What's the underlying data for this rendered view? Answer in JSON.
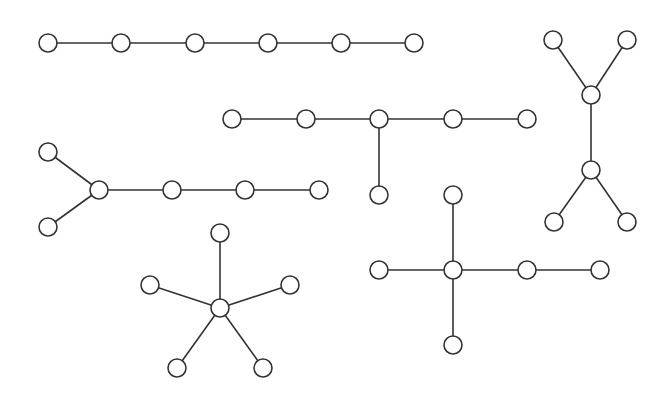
{
  "diagram": {
    "title": "",
    "node_radius": 9,
    "colors": {
      "stroke": "#333333",
      "fill": "#ffffff",
      "background": "#ffffff"
    },
    "graphs": [
      {
        "id": "path-6",
        "nodes": [
          [
            48,
            43
          ],
          [
            121,
            43
          ],
          [
            195,
            43
          ],
          [
            268,
            43
          ],
          [
            341,
            43
          ],
          [
            414,
            43
          ]
        ],
        "edges": [
          [
            0,
            1
          ],
          [
            1,
            2
          ],
          [
            2,
            3
          ],
          [
            3,
            4
          ],
          [
            4,
            5
          ]
        ]
      },
      {
        "id": "tree-branch",
        "nodes": [
          [
            232,
            119
          ],
          [
            306,
            119
          ],
          [
            379,
            119
          ],
          [
            453,
            119
          ],
          [
            527,
            119
          ],
          [
            379,
            195
          ]
        ],
        "edges": [
          [
            0,
            1
          ],
          [
            1,
            2
          ],
          [
            2,
            3
          ],
          [
            3,
            4
          ],
          [
            2,
            5
          ]
        ]
      },
      {
        "id": "h-shape",
        "nodes": [
          [
            553,
            40
          ],
          [
            627,
            40
          ],
          [
            591,
            95
          ],
          [
            591,
            170
          ],
          [
            554,
            222
          ],
          [
            627,
            222
          ]
        ],
        "edges": [
          [
            0,
            2
          ],
          [
            1,
            2
          ],
          [
            2,
            3
          ],
          [
            3,
            4
          ],
          [
            3,
            5
          ]
        ]
      },
      {
        "id": "fork-path",
        "nodes": [
          [
            48,
            152
          ],
          [
            48,
            227
          ],
          [
            99,
            190
          ],
          [
            172,
            190
          ],
          [
            245,
            190
          ],
          [
            319,
            190
          ]
        ],
        "edges": [
          [
            0,
            2
          ],
          [
            1,
            2
          ],
          [
            2,
            3
          ],
          [
            3,
            4
          ],
          [
            4,
            5
          ]
        ]
      },
      {
        "id": "star-5",
        "nodes": [
          [
            220,
            308
          ],
          [
            220,
            233
          ],
          [
            150,
            285
          ],
          [
            290,
            285
          ],
          [
            177,
            368
          ],
          [
            263,
            368
          ]
        ],
        "edges": [
          [
            0,
            1
          ],
          [
            0,
            2
          ],
          [
            0,
            3
          ],
          [
            0,
            4
          ],
          [
            0,
            5
          ]
        ]
      },
      {
        "id": "cross",
        "nodes": [
          [
            453,
            270
          ],
          [
            453,
            195
          ],
          [
            453,
            345
          ],
          [
            379,
            270
          ],
          [
            527,
            270
          ],
          [
            600,
            270
          ]
        ],
        "edges": [
          [
            0,
            1
          ],
          [
            0,
            2
          ],
          [
            0,
            3
          ],
          [
            0,
            4
          ],
          [
            4,
            5
          ]
        ]
      }
    ]
  }
}
